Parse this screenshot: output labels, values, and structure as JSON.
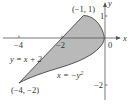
{
  "diagram": {
    "type": "region-between-curves",
    "colors": {
      "region_fill": "#b9b9b9",
      "curve_stroke": "#444444",
      "axis_stroke": "#555555",
      "text": "#333333",
      "background": "#ffffff"
    },
    "axes": {
      "x_label": "x",
      "y_label": "y",
      "origin_label": "0",
      "x_ticks": [
        {
          "value": -4,
          "label": "−4"
        },
        {
          "value": -2,
          "label": "−2"
        }
      ],
      "y_ticks": [
        {
          "value": 1,
          "label": "1"
        },
        {
          "value": -2,
          "label": "−2"
        }
      ]
    },
    "curves": [
      {
        "name": "line",
        "equation": "y = x + 2"
      },
      {
        "name": "parabola",
        "equation_prefix": "x = −y",
        "exponent": "2"
      }
    ],
    "points": [
      {
        "label": "(−1, 1)",
        "x": -1,
        "y": 1
      },
      {
        "label": "(−4, −2)",
        "x": -4,
        "y": -2
      }
    ]
  }
}
